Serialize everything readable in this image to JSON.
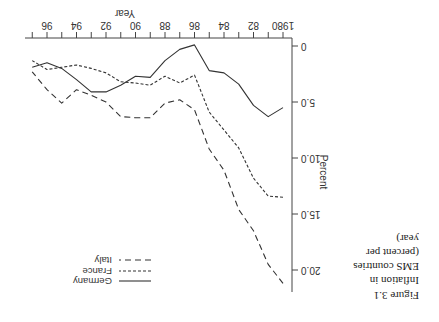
{
  "figure": {
    "label": "Figure 3.1",
    "caption_lines": [
      "Inflation in",
      "EMS countries",
      "(percent per",
      "year)"
    ]
  },
  "legend": {
    "items": [
      {
        "name": "Germany",
        "style": "solid"
      },
      {
        "name": "France",
        "style": "short-dash"
      },
      {
        "name": "Italy",
        "style": "long-dash"
      }
    ]
  },
  "axes": {
    "x_label": "Year",
    "y_label": "Percent",
    "x_ticks": [
      "1980",
      "82",
      "84",
      "86",
      "88",
      "90",
      "92",
      "94",
      "96"
    ],
    "y_ticks": [
      "0",
      "5.0",
      "10.0",
      "15.0",
      "20.0"
    ]
  },
  "chart_data": {
    "type": "line",
    "title": "Figure 3.1 Inflation in EMS countries (percent per year)",
    "xlabel": "Year",
    "ylabel": "Percent",
    "x": [
      1980,
      1981,
      1982,
      1983,
      1984,
      1985,
      1986,
      1987,
      1988,
      1989,
      1990,
      1991,
      1992,
      1993,
      1994,
      1995,
      1996,
      1997
    ],
    "series": [
      {
        "name": "Germany",
        "style": "solid",
        "values": [
          5.5,
          6.3,
          5.3,
          3.4,
          2.4,
          2.2,
          -0.1,
          0.3,
          1.3,
          2.8,
          2.7,
          3.5,
          4.1,
          4.1,
          3.0,
          2.0,
          1.5,
          1.9
        ]
      },
      {
        "name": "France",
        "style": "short-dash",
        "values": [
          13.5,
          13.4,
          11.8,
          9.1,
          7.5,
          5.9,
          2.6,
          3.3,
          2.7,
          3.5,
          3.3,
          3.2,
          2.4,
          2.0,
          1.7,
          1.9,
          2.1,
          1.3
        ]
      },
      {
        "name": "Italy",
        "style": "long-dash",
        "values": [
          21.2,
          19.5,
          16.5,
          14.6,
          11.1,
          9.2,
          5.7,
          4.8,
          5.1,
          6.4,
          6.4,
          6.3,
          5.0,
          4.4,
          3.9,
          5.1,
          3.9,
          2.3
        ]
      }
    ],
    "xlim": [
      1980,
      1997
    ],
    "ylim": [
      0,
      21
    ],
    "y_ticks": [
      0,
      5.0,
      10.0,
      15.0,
      20.0
    ],
    "x_ticks": [
      1980,
      1982,
      1984,
      1986,
      1988,
      1990,
      1992,
      1994,
      1996
    ],
    "legend_position": "top-right",
    "grid": false,
    "orientation_note": "image rendered rotated 180 degrees"
  }
}
